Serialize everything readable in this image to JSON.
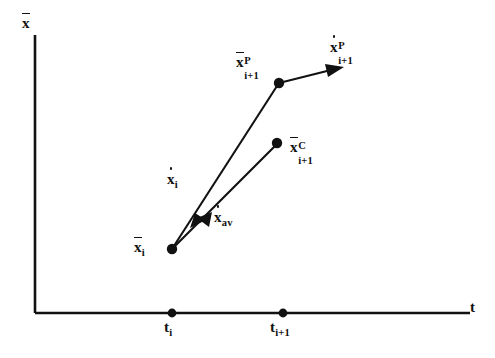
{
  "figure": {
    "type": "diagram",
    "background_color": "#ffffff",
    "ink_color": "#111111"
  },
  "axes": {
    "y_axis": {
      "label": "x",
      "label_accent": "overbar",
      "name": "x-bar"
    },
    "x_axis": {
      "label": "t",
      "name": "t"
    },
    "origin": {
      "x": 35,
      "y": 313
    },
    "y_axis_top": {
      "x": 35,
      "y": 35
    },
    "x_axis_right": {
      "x": 470,
      "y": 313
    }
  },
  "ticks": [
    {
      "id": "t-i",
      "label_base": "t",
      "label_sub": "i",
      "x": 172,
      "y": 313
    },
    {
      "id": "t-i-plus-1",
      "label_base": "t",
      "label_sub": "i+1",
      "x": 283,
      "y": 313
    }
  ],
  "points": [
    {
      "id": "x-i",
      "label_base": "x",
      "accent": "overbar",
      "sub": "i",
      "sup": "",
      "x": 172,
      "y": 249,
      "label_x": 134,
      "label_y": 240
    },
    {
      "id": "x-p-i-plus-1",
      "label_base": "x",
      "accent": "overbar",
      "sub": "i+1",
      "sup": "P",
      "x": 279,
      "y": 83,
      "label_x": 236,
      "label_y": 55
    },
    {
      "id": "x-c-i-plus-1",
      "label_base": "x",
      "accent": "overbar",
      "sub": "i+1",
      "sup": "C",
      "x": 277,
      "y": 143,
      "label_x": 290,
      "label_y": 140
    }
  ],
  "vectors": [
    {
      "id": "x-dot-i",
      "label_base": "x",
      "accent": "overdot",
      "sub": "i",
      "sup": "",
      "description": "slope at step i, from x-i to predicted point",
      "label_x": 167,
      "label_y": 172
    },
    {
      "id": "x-dot-av",
      "label_base": "x",
      "accent": "overdot",
      "sub": "av",
      "sup": "",
      "description": "average slope, from x-i to corrected point",
      "label_x": 214,
      "label_y": 210
    },
    {
      "id": "x-dot-p-i-plus-1",
      "label_base": "x",
      "accent": "overdot",
      "sub": "i+1",
      "sup": "P",
      "description": "slope evaluated at the predicted point",
      "label_x": 330,
      "label_y": 40
    }
  ]
}
